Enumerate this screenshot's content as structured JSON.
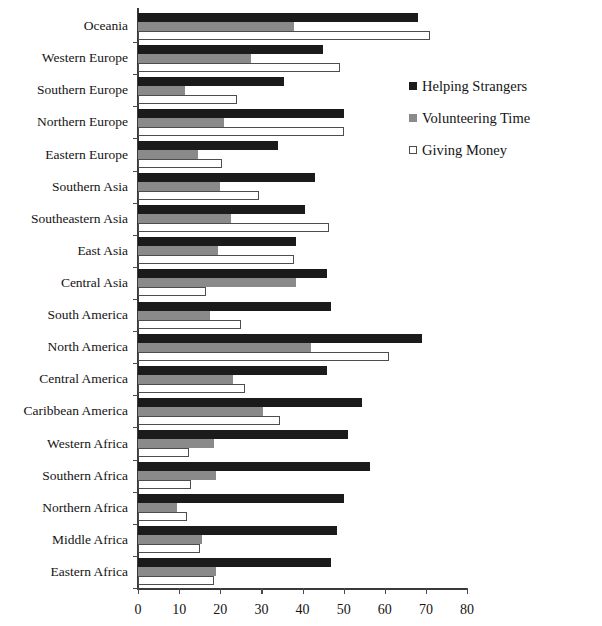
{
  "chart_data": {
    "type": "bar",
    "orientation": "horizontal",
    "title": "",
    "xlabel": "",
    "ylabel": "",
    "xlim": [
      0,
      80
    ],
    "xticks": [
      0,
      10,
      20,
      30,
      40,
      50,
      60,
      70,
      80
    ],
    "grid": false,
    "legend_position": "right-top",
    "categories": [
      "Oceania",
      "Western Europe",
      "Southern Europe",
      "Northern Europe",
      "Eastern Europe",
      "Southern Asia",
      "Southeastern Asia",
      "East Asia",
      "Central Asia",
      "South America",
      "North America",
      "Central America",
      "Caribbean America",
      "Western Africa",
      "Southern Africa",
      "Northern Africa",
      "Middle Africa",
      "Eastern Africa"
    ],
    "series": [
      {
        "name": "Helping Strangers",
        "color": "#1b1b1b",
        "values": [
          68,
          45,
          35.5,
          50,
          34,
          43,
          40.5,
          38.5,
          46,
          47,
          69,
          46,
          54.5,
          51,
          56.5,
          50,
          48.5,
          47
        ]
      },
      {
        "name": "Volunteering Time",
        "color": "#8a8a8a",
        "values": [
          38,
          27.5,
          11.5,
          21,
          14.5,
          20,
          22.5,
          19.5,
          38.5,
          17.5,
          42,
          23,
          30.5,
          18.5,
          19,
          9.5,
          15.5,
          19
        ]
      },
      {
        "name": "Giving Money",
        "color": "#ffffff",
        "values": [
          71,
          49,
          24,
          50,
          20.5,
          29.5,
          46.5,
          38,
          16.5,
          25,
          61,
          26,
          34.5,
          12.5,
          13,
          12,
          15,
          18.5
        ]
      }
    ]
  },
  "legend": {
    "items": [
      {
        "label": "Helping Strangers",
        "swatch": "filled-dark-square-icon"
      },
      {
        "label": "Volunteering Time",
        "swatch": "filled-gray-square-icon"
      },
      {
        "label": "Giving Money",
        "swatch": "outlined-white-square-icon"
      }
    ]
  },
  "axis": {
    "x_tick_labels": [
      "0",
      "10",
      "20",
      "30",
      "40",
      "50",
      "60",
      "70",
      "80"
    ]
  }
}
